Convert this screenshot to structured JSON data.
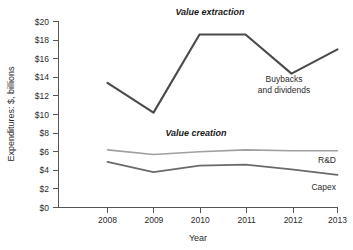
{
  "chart_data": {
    "type": "line",
    "title": "",
    "xlabel": "Year",
    "ylabel": "Expenditures: $, billions",
    "x": [
      2008,
      2009,
      2010,
      2011,
      2012,
      2013
    ],
    "categories": [
      "2008",
      "2009",
      "2010",
      "2011",
      "2012",
      "2013"
    ],
    "xtick_labels": [
      "2008",
      "2009",
      "2010",
      "2011",
      "2012",
      "2013"
    ],
    "ytick_labels": [
      "$0",
      "$2",
      "$4",
      "$6",
      "$8",
      "$10",
      "$12",
      "$14",
      "$16",
      "$18",
      "$20"
    ],
    "ytick_values": [
      0,
      2,
      4,
      6,
      8,
      10,
      12,
      14,
      16,
      18,
      20
    ],
    "ylim": [
      0,
      20
    ],
    "xlim": [
      2008,
      2013
    ],
    "grid": false,
    "legend": "inline-labels",
    "series": [
      {
        "name": "Buybacks and dividends",
        "label": "Buybacks and dividends",
        "label_line1": "Buybacks",
        "label_line2": "and dividends",
        "color": "#4a4a4a",
        "width": 2.1,
        "values": [
          13.4,
          10.2,
          18.6,
          18.6,
          14.4,
          17.0
        ]
      },
      {
        "name": "R&D",
        "label": "R&D",
        "color": "#a0a0a0",
        "width": 1.6,
        "values": [
          6.2,
          5.7,
          6.0,
          6.2,
          6.1,
          6.1
        ]
      },
      {
        "name": "Capex",
        "label": "Capex",
        "color": "#6a6a6a",
        "width": 1.8,
        "values": [
          4.9,
          3.8,
          4.5,
          4.6,
          4.1,
          3.5
        ]
      }
    ],
    "annotations": [
      {
        "text": "Value extraction",
        "x": 2010.45,
        "y": 20.2
      },
      {
        "text": "Value creation",
        "x": 2010.0,
        "y": 8.0
      }
    ]
  }
}
